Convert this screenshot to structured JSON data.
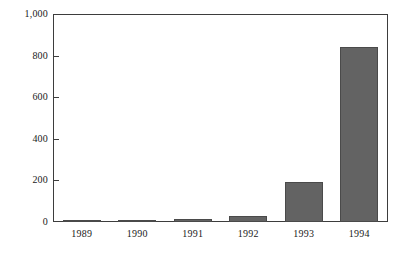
{
  "chart_data": {
    "type": "bar",
    "title": "",
    "subtitle": "",
    "xlabel": "",
    "ylabel": "",
    "categories": [
      "1989",
      "1990",
      "1991",
      "1992",
      "1993",
      "1994"
    ],
    "values": [
      5,
      10,
      15,
      28,
      195,
      845
    ],
    "ylim": [
      0,
      1000
    ],
    "yticks": [
      0,
      200,
      400,
      600,
      800,
      1000
    ],
    "ytick_labels": [
      "0",
      "200",
      "400",
      "600",
      "800",
      "1,000"
    ],
    "grid": false,
    "legend": null,
    "legend_position": "none",
    "annotations": [],
    "colors": {
      "bar_fill": "#636363",
      "bar_edge": "#4a4a4a",
      "axis": "#3d3d3d",
      "text": "#1a1a1a",
      "background": "#ffffff"
    }
  }
}
